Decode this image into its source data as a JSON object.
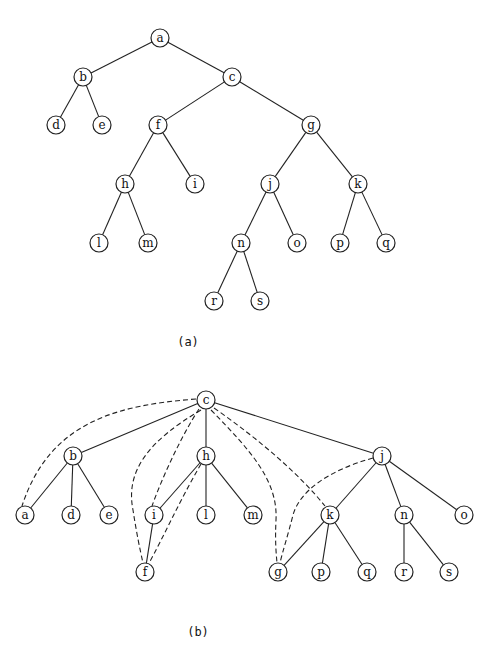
{
  "figure": {
    "panels": [
      {
        "id": "a",
        "caption": "(a)",
        "caption_pos": [
          188,
          346
        ],
        "nodes": [
          {
            "id": "a",
            "x": 160,
            "y": 38
          },
          {
            "id": "b",
            "x": 83,
            "y": 77
          },
          {
            "id": "c",
            "x": 232,
            "y": 77
          },
          {
            "id": "d",
            "x": 56,
            "y": 125
          },
          {
            "id": "e",
            "x": 102,
            "y": 125
          },
          {
            "id": "f",
            "x": 158,
            "y": 125
          },
          {
            "id": "g",
            "x": 311,
            "y": 125
          },
          {
            "id": "h",
            "x": 125,
            "y": 184
          },
          {
            "id": "i",
            "x": 195,
            "y": 184
          },
          {
            "id": "j",
            "x": 270,
            "y": 184
          },
          {
            "id": "k",
            "x": 358,
            "y": 184
          },
          {
            "id": "l",
            "x": 99,
            "y": 243
          },
          {
            "id": "m",
            "x": 148,
            "y": 243
          },
          {
            "id": "n",
            "x": 241,
            "y": 243
          },
          {
            "id": "o",
            "x": 297,
            "y": 243
          },
          {
            "id": "p",
            "x": 340,
            "y": 243
          },
          {
            "id": "q",
            "x": 386,
            "y": 243
          },
          {
            "id": "r",
            "x": 214,
            "y": 301
          },
          {
            "id": "s",
            "x": 260,
            "y": 301
          }
        ],
        "edges": [
          [
            "a",
            "b"
          ],
          [
            "a",
            "c"
          ],
          [
            "b",
            "d"
          ],
          [
            "b",
            "e"
          ],
          [
            "c",
            "f"
          ],
          [
            "c",
            "g"
          ],
          [
            "f",
            "h"
          ],
          [
            "f",
            "i"
          ],
          [
            "g",
            "j"
          ],
          [
            "g",
            "k"
          ],
          [
            "h",
            "l"
          ],
          [
            "h",
            "m"
          ],
          [
            "j",
            "n"
          ],
          [
            "j",
            "o"
          ],
          [
            "k",
            "p"
          ],
          [
            "k",
            "q"
          ],
          [
            "n",
            "r"
          ],
          [
            "n",
            "s"
          ]
        ],
        "dashed_edges": []
      },
      {
        "id": "b",
        "caption": "(b)",
        "caption_pos": [
          198,
          636
        ],
        "nodes": [
          {
            "id": "c",
            "x": 206,
            "y": 400
          },
          {
            "id": "b",
            "x": 73,
            "y": 456
          },
          {
            "id": "h",
            "x": 206,
            "y": 456
          },
          {
            "id": "j",
            "x": 382,
            "y": 456
          },
          {
            "id": "a",
            "x": 25,
            "y": 515
          },
          {
            "id": "d",
            "x": 71,
            "y": 515
          },
          {
            "id": "e",
            "x": 109,
            "y": 515
          },
          {
            "id": "i",
            "x": 154,
            "y": 515
          },
          {
            "id": "l",
            "x": 206,
            "y": 515
          },
          {
            "id": "m",
            "x": 253,
            "y": 515
          },
          {
            "id": "k",
            "x": 330,
            "y": 515
          },
          {
            "id": "n",
            "x": 404,
            "y": 515
          },
          {
            "id": "o",
            "x": 464,
            "y": 515
          },
          {
            "id": "f",
            "x": 145,
            "y": 572
          },
          {
            "id": "g",
            "x": 278,
            "y": 572
          },
          {
            "id": "p",
            "x": 321,
            "y": 572
          },
          {
            "id": "q",
            "x": 367,
            "y": 572
          },
          {
            "id": "r",
            "x": 404,
            "y": 572
          },
          {
            "id": "s",
            "x": 449,
            "y": 572
          }
        ],
        "edges": [
          [
            "c",
            "b"
          ],
          [
            "c",
            "h"
          ],
          [
            "c",
            "j"
          ],
          [
            "b",
            "a"
          ],
          [
            "b",
            "d"
          ],
          [
            "b",
            "e"
          ],
          [
            "h",
            "i"
          ],
          [
            "h",
            "l"
          ],
          [
            "h",
            "m"
          ],
          [
            "i",
            "f"
          ],
          [
            "j",
            "k"
          ],
          [
            "j",
            "n"
          ],
          [
            "j",
            "o"
          ],
          [
            "k",
            "g"
          ],
          [
            "k",
            "p"
          ],
          [
            "k",
            "q"
          ],
          [
            "n",
            "r"
          ],
          [
            "n",
            "s"
          ]
        ],
        "dashed_edges": [
          {
            "from": "c",
            "to": "a",
            "path": "M196,399 C120,405 50,420 22,506"
          },
          {
            "from": "c",
            "to": "i",
            "path": "M199,409 C185,430 165,470 152,506"
          },
          {
            "from": "c",
            "to": "f",
            "path": "M201,410 C150,440 125,470 133,510 C136,530 140,550 143,563"
          },
          {
            "from": "h",
            "to": "f",
            "path": "M201,464 C180,500 162,540 149,563"
          },
          {
            "from": "c",
            "to": "g",
            "path": "M211,410 C250,450 278,480 276,520 C275,540 276,552 277,563"
          },
          {
            "from": "c",
            "to": "k",
            "path": "M214,408 C260,440 300,475 325,506"
          },
          {
            "from": "j",
            "to": "g",
            "path": "M373,458 C330,470 300,490 293,515 C288,535 283,550 280,563"
          }
        ]
      }
    ]
  }
}
